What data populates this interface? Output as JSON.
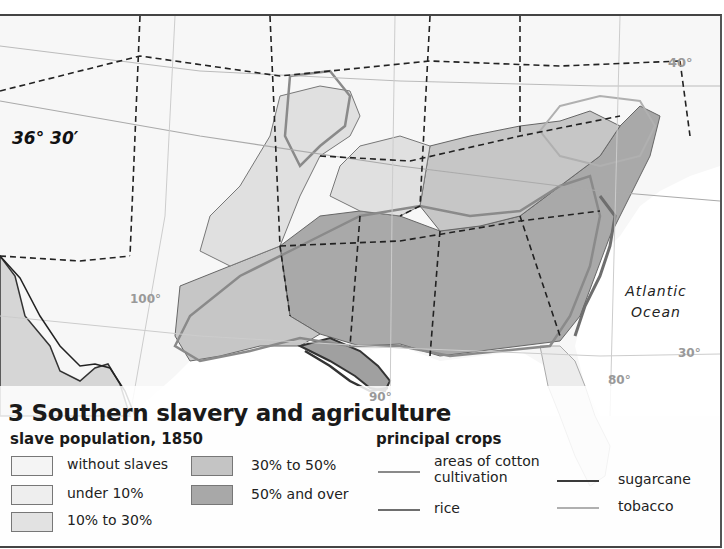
{
  "map": {
    "title": "3 Southern slavery and agriculture",
    "ocean_label": {
      "line1": "Atlantic",
      "line2": "Ocean"
    },
    "parallel_label": "36° 30′",
    "degree_labels": {
      "lat_40": "40°",
      "lat_30": "30°",
      "lon_100": "100°",
      "lon_90": "90°",
      "lon_80": "80°"
    }
  },
  "legend": {
    "slave_population": {
      "title": "slave population, 1850",
      "items": [
        {
          "label": "without slaves",
          "color": "#f4f4f4"
        },
        {
          "label": "under 10%",
          "color": "#eeeeee"
        },
        {
          "label": "10% to 30%",
          "color": "#e2e2e2"
        },
        {
          "label": "30% to 50%",
          "color": "#c4c4c4"
        },
        {
          "label": "50% and over",
          "color": "#a8a8a8"
        }
      ]
    },
    "principal_crops": {
      "title": "principal crops",
      "items": [
        {
          "label": "areas of cotton cultivation",
          "line1": "areas of cotton",
          "line2": "cultivation",
          "color": "#8a8a8a"
        },
        {
          "label": "rice",
          "color": "#6e6e6e"
        },
        {
          "label": "sugarcane",
          "color": "#3a3a3a"
        },
        {
          "label": "tobacco",
          "color": "#b0b0b0"
        }
      ]
    }
  },
  "colors": {
    "land_background": "#f7f7f7",
    "state_border": "#222222",
    "latitude_lines": "#bbbbbb",
    "mexico_fill": "#d8d8d8"
  }
}
